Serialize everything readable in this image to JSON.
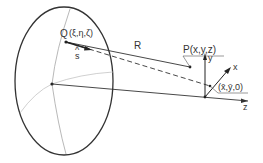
{
  "labels": {
    "Q": "Q",
    "Q_coords": "(ξ,η,ζ)",
    "s": "s",
    "s_hat": "^",
    "R": "R",
    "P": "P(x,y,z)",
    "y_axis": "y",
    "x_axis": "x",
    "z_axis": "z",
    "foot": "(x̄,ȳ,0)"
  },
  "colors": {
    "stroke": "#333333",
    "light_stroke": "#aaaaaa",
    "background": "#ffffff"
  }
}
